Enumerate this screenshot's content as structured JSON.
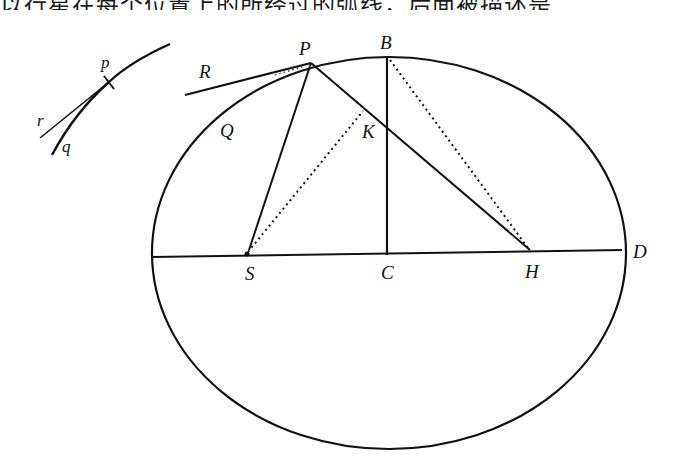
{
  "header": {
    "clipped_text": "以行星在每个位置上的所经过的弧线，后面被描述是"
  },
  "figure": {
    "ellipse": {
      "cx": 389,
      "cy": 253,
      "rx": 237,
      "ry": 196
    },
    "labels": {
      "P": "P",
      "B": "B",
      "R": "R",
      "Q": "Q",
      "K": "K",
      "S": "S",
      "C": "C",
      "H": "H",
      "D": "D",
      "p": "p",
      "r": "r",
      "q": "q"
    },
    "points": {
      "P": [
        311,
        63
      ],
      "B": [
        387,
        56
      ],
      "K": [
        387,
        128
      ],
      "S": [
        247,
        254
      ],
      "C": [
        387,
        255
      ],
      "H": [
        530,
        250
      ],
      "D": [
        626,
        250
      ],
      "R_end": [
        185,
        95
      ]
    },
    "inset": {
      "p": [
        109,
        82
      ],
      "curve_start": [
        170,
        44
      ],
      "curve_end": [
        52,
        155
      ],
      "tangent_end": [
        40,
        138
      ]
    }
  }
}
